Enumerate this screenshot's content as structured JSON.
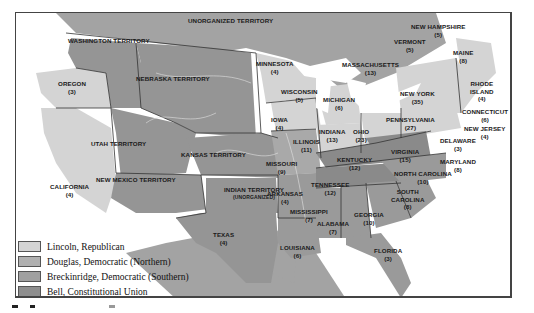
{
  "map": {
    "title": "Election of 1860",
    "colors": {
      "lincoln": "#d4d4d4",
      "douglas": "#a9a9a9",
      "breckinridge": "#9a9a9a",
      "bell": "#8a8a8a",
      "territory": "#959595",
      "foreign": "#a3a3a3",
      "water": "#ffffff",
      "border": "#333333"
    },
    "legend": [
      {
        "label": "Lincoln, Republican",
        "color": "#d4d4d4"
      },
      {
        "label": "Douglas, Democratic (Northern)",
        "color": "#b0b0b0"
      },
      {
        "label": "Breckinridge, Democratic (Southern)",
        "color": "#a0a0a0"
      },
      {
        "label": "Bell, Constitutional Union",
        "color": "#8e8e8e"
      }
    ],
    "regions": [
      {
        "name": "UNORGANIZED TERRITORY",
        "votes": ""
      },
      {
        "name": "WASHINGTON TERRITORY",
        "votes": ""
      },
      {
        "name": "OREGON",
        "votes": "(3)"
      },
      {
        "name": "NEBRASKA TERRITORY",
        "votes": ""
      },
      {
        "name": "UTAH TERRITORY",
        "votes": ""
      },
      {
        "name": "KANSAS TERRITORY",
        "votes": ""
      },
      {
        "name": "NEW MEXICO TERRITORY",
        "votes": ""
      },
      {
        "name": "CALIFORNIA",
        "votes": "(4)"
      },
      {
        "name": "INDIAN TERRITORY",
        "votes": "(UNORGANIZED)"
      },
      {
        "name": "TEXAS",
        "votes": "(4)"
      },
      {
        "name": "MINNESOTA",
        "votes": "(4)"
      },
      {
        "name": "WISCONSIN",
        "votes": "(5)"
      },
      {
        "name": "IOWA",
        "votes": "(4)"
      },
      {
        "name": "MICHIGAN",
        "votes": "(6)"
      },
      {
        "name": "ILLINOIS",
        "votes": "(11)"
      },
      {
        "name": "INDIANA",
        "votes": "(13)"
      },
      {
        "name": "OHIO",
        "votes": "(23)"
      },
      {
        "name": "MISSOURI",
        "votes": "(9)"
      },
      {
        "name": "KENTUCKY",
        "votes": "(12)"
      },
      {
        "name": "ARKANSAS",
        "votes": "(4)"
      },
      {
        "name": "TENNESSEE",
        "votes": "(12)"
      },
      {
        "name": "MISSISSIPPI",
        "votes": "(7)"
      },
      {
        "name": "ALABAMA",
        "votes": "(7)"
      },
      {
        "name": "GEORGIA",
        "votes": "(10)"
      },
      {
        "name": "LOUISIANA",
        "votes": "(6)"
      },
      {
        "name": "FLORIDA",
        "votes": "(3)"
      },
      {
        "name": "SOUTH CAROLINA",
        "votes": "(8)"
      },
      {
        "name": "NORTH CAROLINA",
        "votes": "(10)"
      },
      {
        "name": "VIRGINIA",
        "votes": "(15)"
      },
      {
        "name": "PENNSYLVANIA",
        "votes": "(27)"
      },
      {
        "name": "NEW YORK",
        "votes": "(35)"
      },
      {
        "name": "NEW HAMPSHIRE",
        "votes": "(5)"
      },
      {
        "name": "VERMONT",
        "votes": "(5)"
      },
      {
        "name": "MASSACHUSETTS",
        "votes": "(13)"
      },
      {
        "name": "MAINE",
        "votes": "(8)"
      },
      {
        "name": "RHODE ISLAND",
        "votes": "(4)"
      },
      {
        "name": "CONNECTICUT",
        "votes": "(6)"
      },
      {
        "name": "NEW JERSEY",
        "votes": "(4)"
      },
      {
        "name": "DELAWARE",
        "votes": "(3)"
      },
      {
        "name": "MARYLAND",
        "votes": "(8)"
      }
    ]
  }
}
